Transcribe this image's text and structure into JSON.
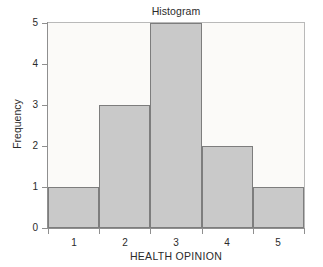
{
  "chart_data": {
    "type": "bar",
    "title": "Histogram",
    "xlabel": "HEALTH OPINION",
    "ylabel": "Frequency",
    "categories": [
      "1",
      "2",
      "3",
      "4",
      "5"
    ],
    "values": [
      1,
      3,
      5,
      2,
      1
    ],
    "x": [
      1,
      2,
      3,
      4,
      5
    ],
    "xlim": [
      0.5,
      5.5
    ],
    "ylim": [
      0,
      5
    ],
    "xticks": [
      "1",
      "2",
      "3",
      "4",
      "5"
    ],
    "yticks": [
      "0",
      "1",
      "2",
      "3",
      "4",
      "5"
    ],
    "grid": false,
    "legend": null,
    "bin_width": 1,
    "series": [
      {
        "name": "Frequency",
        "values": [
          1,
          3,
          5,
          2,
          1
        ]
      }
    ],
    "colors": {
      "bar_fill": "#c9c9c9",
      "bar_edge": "#7d7d7d",
      "panel_background": "#fbfaf8",
      "frame": "#b9b9b9",
      "axis": "#8f8f8f",
      "text": "#2b2b2b",
      "figure_background": "#ffffff"
    }
  }
}
